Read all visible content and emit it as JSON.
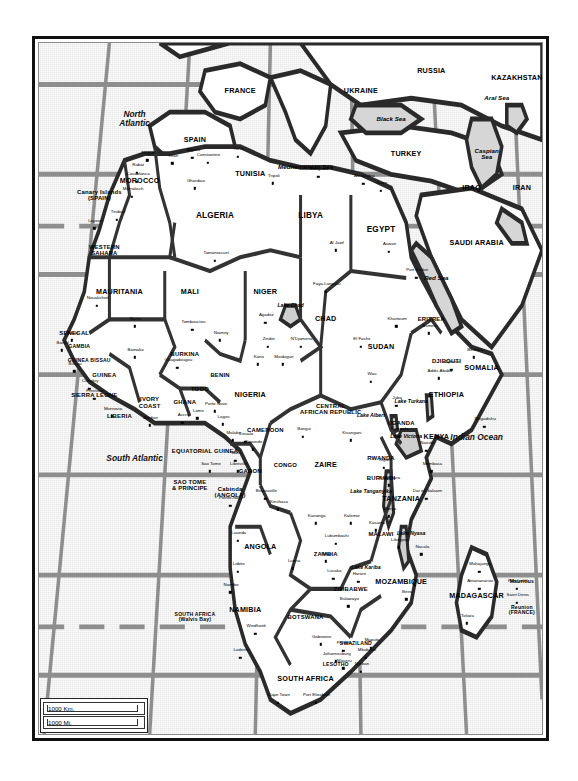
{
  "document": {
    "type": "map",
    "title": "Africa — Political Map",
    "frame": {
      "border_color": "#111111"
    }
  },
  "scale": {
    "km_label": "1000 Km.",
    "mi_label": "1000 Mi."
  },
  "oceans": [
    {
      "name": "North Atlantic",
      "x": 19,
      "y": 11,
      "lines": [
        "North",
        "Atlantic"
      ]
    },
    {
      "name": "South Atlantic",
      "x": 19,
      "y": 60,
      "lines": [
        "South Atlantic"
      ]
    },
    {
      "name": "Indian Ocean",
      "x": 87,
      "y": 57,
      "lines": [
        "Indian Ocean"
      ]
    }
  ],
  "seas": [
    {
      "name": "Mediterranean Sea",
      "x": 53,
      "y": 18
    },
    {
      "name": "Black Sea",
      "x": 70,
      "y": 11
    },
    {
      "name": "Caspian Sea",
      "x": 89,
      "y": 16,
      "lines": [
        "Caspian",
        "Sea"
      ]
    },
    {
      "name": "Aral Sea",
      "x": 91,
      "y": 8
    },
    {
      "name": "Red Sea",
      "x": 79,
      "y": 34
    }
  ],
  "lakes": [
    {
      "name": "Lake Chad",
      "x": 50,
      "y": 38
    },
    {
      "name": "Lake Albert",
      "x": 66,
      "y": 54
    },
    {
      "name": "Lake Turkana",
      "x": 74,
      "y": 52
    },
    {
      "name": "Lake Victoria",
      "x": 73,
      "y": 57
    },
    {
      "name": "Lake Tanganyika",
      "x": 66,
      "y": 65
    },
    {
      "name": "Lake Nyasa",
      "x": 74,
      "y": 71
    },
    {
      "name": "Lake Kariba",
      "x": 65,
      "y": 76
    }
  ],
  "countries": [
    {
      "name": "RUSSIA",
      "x": 78,
      "y": 4,
      "size": "country"
    },
    {
      "name": "UKRAINE",
      "x": 64,
      "y": 7,
      "size": "country"
    },
    {
      "name": "KAZAKHSTAN",
      "x": 95,
      "y": 5,
      "size": "country"
    },
    {
      "name": "FRANCE",
      "x": 40,
      "y": 7,
      "size": "country"
    },
    {
      "name": "SPAIN",
      "x": 31,
      "y": 14,
      "size": "country"
    },
    {
      "name": "TURKEY",
      "x": 73,
      "y": 16,
      "size": "country"
    },
    {
      "name": "IRAQ",
      "x": 86,
      "y": 21,
      "size": "country"
    },
    {
      "name": "IRAN",
      "x": 96,
      "y": 21,
      "size": "country"
    },
    {
      "name": "SAUDI ARABIA",
      "x": 87,
      "y": 29,
      "size": "country"
    },
    {
      "name": "MOROCCO",
      "x": 20,
      "y": 20,
      "size": "country"
    },
    {
      "name": "TUNISIA",
      "x": 42,
      "y": 19,
      "size": "country"
    },
    {
      "name": "ALGERIA",
      "x": 35,
      "y": 25,
      "size": "big"
    },
    {
      "name": "LIBYA",
      "x": 54,
      "y": 25,
      "size": "big"
    },
    {
      "name": "EGYPT",
      "x": 68,
      "y": 27,
      "size": "big"
    },
    {
      "name": "Canary Islands (SPAIN)",
      "x": 12,
      "y": 22,
      "size": "sm",
      "lines": [
        "Canary Islands",
        "(SPAIN)"
      ]
    },
    {
      "name": "WESTERN SAHARA",
      "x": 13,
      "y": 30,
      "size": "sm",
      "lines": [
        "WESTERN",
        "SAHARA"
      ]
    },
    {
      "name": "MAURITANIA",
      "x": 16,
      "y": 36,
      "size": "country"
    },
    {
      "name": "MALI",
      "x": 30,
      "y": 36,
      "size": "country"
    },
    {
      "name": "NIGER",
      "x": 45,
      "y": 36,
      "size": "country"
    },
    {
      "name": "CHAD",
      "x": 57,
      "y": 40,
      "size": "country"
    },
    {
      "name": "SUDAN",
      "x": 68,
      "y": 44,
      "size": "country"
    },
    {
      "name": "ERITREA",
      "x": 78,
      "y": 40,
      "size": "sm"
    },
    {
      "name": "DJIBOUTI",
      "x": 81,
      "y": 46,
      "size": "sm"
    },
    {
      "name": "SOMALIA",
      "x": 88,
      "y": 47,
      "size": "country"
    },
    {
      "name": "ETHIOPIA",
      "x": 81,
      "y": 51,
      "size": "country"
    },
    {
      "name": "SENEGAL",
      "x": 7,
      "y": 42,
      "size": "sm"
    },
    {
      "name": "GAMBIA",
      "x": 8,
      "y": 44,
      "size": "xs"
    },
    {
      "name": "GUINEA BISSAU",
      "x": 10,
      "y": 46,
      "size": "xs"
    },
    {
      "name": "GUINEA",
      "x": 13,
      "y": 48,
      "size": "sm"
    },
    {
      "name": "SIERRA LEONE",
      "x": 11,
      "y": 51,
      "size": "sm"
    },
    {
      "name": "LIBERIA",
      "x": 16,
      "y": 54,
      "size": "sm"
    },
    {
      "name": "IVORY COAST",
      "x": 22,
      "y": 52,
      "size": "sm",
      "lines": [
        "IVORY",
        "COAST"
      ]
    },
    {
      "name": "BURKINA",
      "x": 29,
      "y": 45,
      "size": "sm"
    },
    {
      "name": "GHANA",
      "x": 29,
      "y": 52,
      "size": "sm"
    },
    {
      "name": "TOGO",
      "x": 32,
      "y": 50,
      "size": "sm"
    },
    {
      "name": "BENIN",
      "x": 36,
      "y": 48,
      "size": "sm"
    },
    {
      "name": "NIGERIA",
      "x": 42,
      "y": 51,
      "size": "country"
    },
    {
      "name": "CAMEROON",
      "x": 45,
      "y": 56,
      "size": "sm"
    },
    {
      "name": "CENTRAL AFRICAN REPUBLIC",
      "x": 58,
      "y": 53,
      "size": "sm",
      "lines": [
        "CENTRAL",
        "AFRICAN REPUBLIC"
      ]
    },
    {
      "name": "EQUATORIAL GUINEA",
      "x": 33,
      "y": 59,
      "size": "sm"
    },
    {
      "name": "SAO TOME & PRINCIPE",
      "x": 30,
      "y": 64,
      "size": "sm",
      "lines": [
        "SAO TOME",
        "& PRINCIPE"
      ]
    },
    {
      "name": "GABON",
      "x": 42,
      "y": 62,
      "size": "sm"
    },
    {
      "name": "CONGO",
      "x": 49,
      "y": 61,
      "size": "sm"
    },
    {
      "name": "ZAIRE",
      "x": 57,
      "y": 61,
      "size": "country"
    },
    {
      "name": "RWANDA",
      "x": 68,
      "y": 60,
      "size": "sm"
    },
    {
      "name": "BURUNDI",
      "x": 68,
      "y": 63,
      "size": "sm"
    },
    {
      "name": "UGANDA",
      "x": 72,
      "y": 55,
      "size": "sm"
    },
    {
      "name": "KENYA",
      "x": 79,
      "y": 57,
      "size": "country"
    },
    {
      "name": "TANZANIA",
      "x": 72,
      "y": 66,
      "size": "country"
    },
    {
      "name": "Cabinda (ANGOLA)",
      "x": 38,
      "y": 65,
      "size": "sm",
      "lines": [
        "Cabinda",
        "(ANGOLA)"
      ]
    },
    {
      "name": "ANGOLA",
      "x": 44,
      "y": 73,
      "size": "country"
    },
    {
      "name": "ZAMBIA",
      "x": 57,
      "y": 74,
      "size": "sm"
    },
    {
      "name": "MALAWI",
      "x": 68,
      "y": 71,
      "size": "sm"
    },
    {
      "name": "MOZAMBIQUE",
      "x": 72,
      "y": 78,
      "size": "country"
    },
    {
      "name": "ZIMBABWE",
      "x": 62,
      "y": 79,
      "size": "sm"
    },
    {
      "name": "BOTSWANA",
      "x": 53,
      "y": 83,
      "size": "sm"
    },
    {
      "name": "NAMIBIA",
      "x": 41,
      "y": 82,
      "size": "country"
    },
    {
      "name": "SOUTH AFRICA (Walvis Bay)",
      "x": 31,
      "y": 83,
      "size": "xs",
      "lines": [
        "SOUTH AFRICA",
        "(Walvis Bay)"
      ]
    },
    {
      "name": "SWAZILAND",
      "x": 63,
      "y": 87,
      "size": "xs"
    },
    {
      "name": "LESOTHO",
      "x": 59,
      "y": 90,
      "size": "xs"
    },
    {
      "name": "SOUTH AFRICA",
      "x": 53,
      "y": 92,
      "size": "country"
    },
    {
      "name": "MADAGASCAR",
      "x": 87,
      "y": 80,
      "size": "country"
    },
    {
      "name": "Mauritius",
      "x": 96,
      "y": 78,
      "size": "xs"
    },
    {
      "name": "Reunion (FRANCE)",
      "x": 96,
      "y": 82,
      "size": "xs",
      "lines": [
        "Reunion",
        "(FRANCE)"
      ]
    }
  ],
  "cities": [
    {
      "name": "Tangier",
      "x": 21.5,
      "y": 17.0
    },
    {
      "name": "Rabat",
      "x": 19.5,
      "y": 18.8
    },
    {
      "name": "Casablanca",
      "x": 19.5,
      "y": 20.1
    },
    {
      "name": "Marrakech",
      "x": 18.5,
      "y": 22.3
    },
    {
      "name": "Oran",
      "x": 26.5,
      "y": 17.4
    },
    {
      "name": "Algiers",
      "x": 30.5,
      "y": 16.6
    },
    {
      "name": "Constantine",
      "x": 33.5,
      "y": 17.3
    },
    {
      "name": "Tunis",
      "x": 39.5,
      "y": 16.5
    },
    {
      "name": "Ghardaia",
      "x": 31.0,
      "y": 21.0
    },
    {
      "name": "Tripoli",
      "x": 46.5,
      "y": 20.3
    },
    {
      "name": "Benghazi",
      "x": 55.5,
      "y": 19.4
    },
    {
      "name": "Alexandria",
      "x": 64.5,
      "y": 20.4
    },
    {
      "name": "Cairo",
      "x": 68.0,
      "y": 21.4
    },
    {
      "name": "Tindouf",
      "x": 15.5,
      "y": 25.6
    },
    {
      "name": "Layoun",
      "x": 11.0,
      "y": 26.8
    },
    {
      "name": "Tamanrasset",
      "x": 35.0,
      "y": 31.5
    },
    {
      "name": "Al Jawf",
      "x": 59.0,
      "y": 30.0
    },
    {
      "name": "Aswan",
      "x": 69.5,
      "y": 30.2
    },
    {
      "name": "Nouakchott",
      "x": 11.5,
      "y": 38.0
    },
    {
      "name": "Nema",
      "x": 19.0,
      "y": 41.0
    },
    {
      "name": "Tombouctou",
      "x": 30.5,
      "y": 41.5
    },
    {
      "name": "Agadez",
      "x": 45.0,
      "y": 40.5
    },
    {
      "name": "Zinder",
      "x": 45.5,
      "y": 44.0
    },
    {
      "name": "Faya-Largeau",
      "x": 57.0,
      "y": 36.0
    },
    {
      "name": "N'Djamena",
      "x": 52.0,
      "y": 44.0
    },
    {
      "name": "Port Sudan",
      "x": 75.0,
      "y": 34.0
    },
    {
      "name": "Khartoum",
      "x": 71.0,
      "y": 41.0
    },
    {
      "name": "El Fashir",
      "x": 64.0,
      "y": 44.0
    },
    {
      "name": "Wau",
      "x": 66.0,
      "y": 49.0
    },
    {
      "name": "Asmera",
      "x": 77.5,
      "y": 42.0
    },
    {
      "name": "Djibouti",
      "x": 82.0,
      "y": 47.3
    },
    {
      "name": "Berbera",
      "x": 86.5,
      "y": 45.5
    },
    {
      "name": "Addis Ababa",
      "x": 79.5,
      "y": 48.5
    },
    {
      "name": "Mogadishu",
      "x": 88.5,
      "y": 55.5
    },
    {
      "name": "Nairobi",
      "x": 77.0,
      "y": 59.0
    },
    {
      "name": "Juba",
      "x": 71.0,
      "y": 52.5
    },
    {
      "name": "Kampala",
      "x": 71.5,
      "y": 57.0
    },
    {
      "name": "Kigali",
      "x": 68.5,
      "y": 61.5
    },
    {
      "name": "Bujumbura",
      "x": 69.5,
      "y": 64.0
    },
    {
      "name": "Dakar",
      "x": 6.5,
      "y": 43.0
    },
    {
      "name": "Banjul",
      "x": 4.5,
      "y": 44.5
    },
    {
      "name": "Bissau",
      "x": 7.0,
      "y": 47.5
    },
    {
      "name": "Conakry",
      "x": 10.0,
      "y": 50.0
    },
    {
      "name": "Freetown",
      "x": 11.0,
      "y": 51.5
    },
    {
      "name": "Monrovia",
      "x": 14.5,
      "y": 54.0
    },
    {
      "name": "Abidjan",
      "x": 22.0,
      "y": 55.3
    },
    {
      "name": "Bamako",
      "x": 19.0,
      "y": 45.5
    },
    {
      "name": "Ouagadougou",
      "x": 27.5,
      "y": 47.0
    },
    {
      "name": "Accra",
      "x": 28.5,
      "y": 55.0
    },
    {
      "name": "Lome",
      "x": 31.5,
      "y": 54.3
    },
    {
      "name": "Porto Novo",
      "x": 35.0,
      "y": 53.3
    },
    {
      "name": "Lagos",
      "x": 36.5,
      "y": 55.2
    },
    {
      "name": "Kano",
      "x": 43.5,
      "y": 46.5
    },
    {
      "name": "Maiduguri",
      "x": 48.5,
      "y": 46.5
    },
    {
      "name": "Niamey",
      "x": 36.0,
      "y": 43.0
    },
    {
      "name": "Malabo",
      "x": 38.5,
      "y": 57.5
    },
    {
      "name": "Douala",
      "x": 41.0,
      "y": 57.7
    },
    {
      "name": "Yaounde",
      "x": 42.5,
      "y": 58.8
    },
    {
      "name": "Bangui",
      "x": 52.5,
      "y": 57.0
    },
    {
      "name": "Bata",
      "x": 39.0,
      "y": 60.5
    },
    {
      "name": "Libreville",
      "x": 39.5,
      "y": 62.0
    },
    {
      "name": "Sao Tome",
      "x": 34.0,
      "y": 62.0
    },
    {
      "name": "Brazzaville",
      "x": 45.0,
      "y": 66.0
    },
    {
      "name": "Kinshasa",
      "x": 47.5,
      "y": 67.5
    },
    {
      "name": "Pointe-Noire",
      "x": 38.0,
      "y": 67.0
    },
    {
      "name": "Kisangani",
      "x": 62.0,
      "y": 57.5
    },
    {
      "name": "Kananga",
      "x": 55.0,
      "y": 69.5
    },
    {
      "name": "Kalemie",
      "x": 62.0,
      "y": 69.5
    },
    {
      "name": "Luanda",
      "x": 39.5,
      "y": 72.0
    },
    {
      "name": "Lobito",
      "x": 39.5,
      "y": 76.5
    },
    {
      "name": "Namibe",
      "x": 38.0,
      "y": 79.5
    },
    {
      "name": "Luena",
      "x": 50.5,
      "y": 76.0
    },
    {
      "name": "Lubumbashi",
      "x": 59.0,
      "y": 72.5
    },
    {
      "name": "Kitwe",
      "x": 57.0,
      "y": 75.0
    },
    {
      "name": "Lusaka",
      "x": 58.5,
      "y": 77.5
    },
    {
      "name": "Mbeya",
      "x": 69.5,
      "y": 68.5
    },
    {
      "name": "Kasama",
      "x": 67.0,
      "y": 70.5
    },
    {
      "name": "Lilongwe",
      "x": 71.5,
      "y": 73.0
    },
    {
      "name": "Nacala",
      "x": 76.0,
      "y": 74.0
    },
    {
      "name": "Harare",
      "x": 63.5,
      "y": 78.0
    },
    {
      "name": "Beira",
      "x": 73.0,
      "y": 80.5
    },
    {
      "name": "Bulawayo",
      "x": 61.5,
      "y": 81.5
    },
    {
      "name": "Mombasa",
      "x": 78.0,
      "y": 62.0
    },
    {
      "name": "Dar es Salaam",
      "x": 77.0,
      "y": 66.0
    },
    {
      "name": "Mahajanga",
      "x": 87.5,
      "y": 76.5
    },
    {
      "name": "Antananarivo",
      "x": 87.5,
      "y": 79.0
    },
    {
      "name": "Toliara",
      "x": 85.0,
      "y": 84.0
    },
    {
      "name": "Port Louis",
      "x": 95.0,
      "y": 79.0
    },
    {
      "name": "Saint Denis",
      "x": 95.0,
      "y": 81.0
    },
    {
      "name": "Windhoek",
      "x": 43.0,
      "y": 85.5
    },
    {
      "name": "Luderitz",
      "x": 40.0,
      "y": 89.0
    },
    {
      "name": "Gaborone",
      "x": 56.0,
      "y": 87.0
    },
    {
      "name": "Pretoria",
      "x": 60.5,
      "y": 88.0
    },
    {
      "name": "Johannesburg",
      "x": 59.0,
      "y": 89.5
    },
    {
      "name": "Maputo",
      "x": 66.0,
      "y": 87.5
    },
    {
      "name": "Mbabane",
      "x": 65.0,
      "y": 89.0
    },
    {
      "name": "Maseru",
      "x": 60.5,
      "y": 90.5
    },
    {
      "name": "Durban",
      "x": 64.0,
      "y": 91.0
    },
    {
      "name": "Cape Town",
      "x": 47.5,
      "y": 95.5
    },
    {
      "name": "Port Elizabeth",
      "x": 55.0,
      "y": 95.5
    }
  ]
}
